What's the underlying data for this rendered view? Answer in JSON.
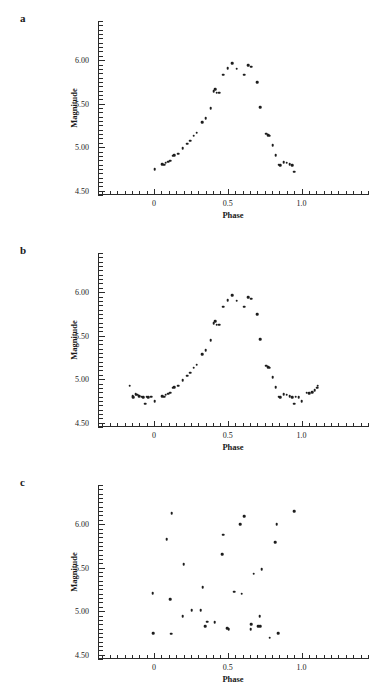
{
  "figure": {
    "panels": [
      {
        "letter": "a"
      },
      {
        "letter": "b"
      },
      {
        "letter": "c"
      }
    ],
    "axis_titles": {
      "x": "Phase",
      "y": "Magnitude"
    }
  },
  "chart_data": [
    {
      "type": "scatter",
      "panel": "a",
      "title": "",
      "xlabel": "Phase",
      "ylabel": "Magnitude",
      "xlim": [
        -0.38,
        1.45
      ],
      "ylim": [
        6.45,
        4.45
      ],
      "y_inverted": true,
      "xticks": [
        0,
        0.5,
        1.0
      ],
      "xticklabels": [
        "0",
        "0.5",
        "1.0"
      ],
      "yticks": [
        4.5,
        5.0,
        5.5,
        6.0
      ],
      "yticklabels": [
        "4.50",
        "5.00",
        "5.50",
        "6.00"
      ],
      "xtick_minor_step": 0.05,
      "ytick_minor_step": 0.05,
      "grid": false,
      "legend": null,
      "marker": "filled-circle",
      "color": "#1d1d1d",
      "points": [
        [
          0.005,
          4.745
        ],
        [
          0.055,
          4.805
        ],
        [
          0.07,
          4.8
        ],
        [
          0.08,
          4.82
        ],
        [
          0.095,
          4.835
        ],
        [
          0.11,
          4.845
        ],
        [
          0.125,
          4.9
        ],
        [
          0.135,
          4.905
        ],
        [
          0.165,
          4.925
        ],
        [
          0.195,
          4.99
        ],
        [
          0.225,
          5.04
        ],
        [
          0.245,
          5.075
        ],
        [
          0.27,
          5.13
        ],
        [
          0.29,
          5.165
        ],
        [
          0.325,
          5.29
        ],
        [
          0.35,
          5.33
        ],
        [
          0.385,
          5.445
        ],
        [
          0.405,
          5.64
        ],
        [
          0.415,
          5.665
        ],
        [
          0.425,
          5.625
        ],
        [
          0.44,
          5.625
        ],
        [
          0.47,
          5.835
        ],
        [
          0.5,
          5.905
        ],
        [
          0.53,
          5.965
        ],
        [
          0.56,
          5.9
        ],
        [
          0.61,
          5.835
        ],
        [
          0.64,
          5.945
        ],
        [
          0.66,
          5.925
        ],
        [
          0.7,
          5.745
        ],
        [
          0.72,
          5.46
        ],
        [
          0.76,
          5.155
        ],
        [
          0.775,
          5.14
        ],
        [
          0.785,
          5.13
        ],
        [
          0.805,
          5.025
        ],
        [
          0.825,
          4.905
        ],
        [
          0.845,
          4.8
        ],
        [
          0.855,
          4.79
        ],
        [
          0.88,
          4.83
        ],
        [
          0.9,
          4.82
        ],
        [
          0.92,
          4.805
        ],
        [
          0.935,
          4.79
        ],
        [
          0.95,
          4.72
        ]
      ]
    },
    {
      "type": "scatter",
      "panel": "b",
      "title": "",
      "xlabel": "Phase",
      "ylabel": "Magnitude",
      "xlim": [
        -0.38,
        1.45
      ],
      "ylim": [
        6.45,
        4.45
      ],
      "y_inverted": true,
      "xticks": [
        0,
        0.5,
        1.0
      ],
      "xticklabels": [
        "0",
        "0.5",
        "1.0"
      ],
      "yticks": [
        4.5,
        5.0,
        5.5,
        6.0
      ],
      "yticklabels": [
        "4.50",
        "5.00",
        "5.50",
        "6.00"
      ],
      "xtick_minor_step": 0.05,
      "ytick_minor_step": 0.05,
      "grid": false,
      "legend": null,
      "marker": "filled-circle",
      "color": "#1d1d1d",
      "points": [
        [
          -0.165,
          4.925
        ],
        [
          -0.145,
          4.805
        ],
        [
          -0.14,
          4.79
        ],
        [
          -0.125,
          4.83
        ],
        [
          -0.115,
          4.82
        ],
        [
          -0.1,
          4.805
        ],
        [
          -0.085,
          4.8
        ],
        [
          -0.075,
          4.79
        ],
        [
          -0.06,
          4.72
        ],
        [
          -0.05,
          4.8
        ],
        [
          -0.04,
          4.79
        ],
        [
          -0.02,
          4.8
        ],
        [
          0.005,
          4.745
        ],
        [
          0.055,
          4.805
        ],
        [
          0.07,
          4.8
        ],
        [
          0.08,
          4.82
        ],
        [
          0.095,
          4.835
        ],
        [
          0.11,
          4.845
        ],
        [
          0.125,
          4.9
        ],
        [
          0.135,
          4.905
        ],
        [
          0.165,
          4.925
        ],
        [
          0.195,
          4.99
        ],
        [
          0.225,
          5.04
        ],
        [
          0.245,
          5.075
        ],
        [
          0.27,
          5.13
        ],
        [
          0.29,
          5.165
        ],
        [
          0.325,
          5.29
        ],
        [
          0.35,
          5.33
        ],
        [
          0.385,
          5.445
        ],
        [
          0.405,
          5.64
        ],
        [
          0.415,
          5.665
        ],
        [
          0.425,
          5.625
        ],
        [
          0.44,
          5.625
        ],
        [
          0.47,
          5.835
        ],
        [
          0.5,
          5.905
        ],
        [
          0.53,
          5.965
        ],
        [
          0.56,
          5.9
        ],
        [
          0.61,
          5.835
        ],
        [
          0.64,
          5.945
        ],
        [
          0.66,
          5.925
        ],
        [
          0.7,
          5.745
        ],
        [
          0.72,
          5.46
        ],
        [
          0.76,
          5.155
        ],
        [
          0.775,
          5.14
        ],
        [
          0.785,
          5.13
        ],
        [
          0.805,
          5.025
        ],
        [
          0.825,
          4.905
        ],
        [
          0.845,
          4.8
        ],
        [
          0.855,
          4.79
        ],
        [
          0.88,
          4.83
        ],
        [
          0.9,
          4.82
        ],
        [
          0.92,
          4.805
        ],
        [
          0.935,
          4.79
        ],
        [
          0.95,
          4.72
        ],
        [
          0.96,
          4.8
        ],
        [
          0.98,
          4.79
        ],
        [
          1.0,
          4.745
        ],
        [
          1.035,
          4.845
        ],
        [
          1.05,
          4.84
        ],
        [
          1.07,
          4.85
        ],
        [
          1.09,
          4.87
        ],
        [
          1.105,
          4.9
        ],
        [
          1.11,
          4.925
        ]
      ]
    },
    {
      "type": "scatter",
      "panel": "c",
      "title": "",
      "xlabel": "Phase",
      "ylabel": "Magnitude",
      "xlim": [
        -0.38,
        1.45
      ],
      "ylim": [
        6.45,
        4.45
      ],
      "y_inverted": true,
      "xticks": [
        0,
        0.5,
        1.0
      ],
      "xticklabels": [
        "0",
        "0.5",
        "1.0"
      ],
      "yticks": [
        4.5,
        5.0,
        5.5,
        6.0
      ],
      "yticklabels": [
        "4.50",
        "5.00",
        "5.50",
        "6.00"
      ],
      "xtick_minor_step": 0.05,
      "ytick_minor_step": 0.05,
      "grid": false,
      "legend": null,
      "marker": "filled-circle",
      "color": "#1d1d1d",
      "points": [
        [
          -0.005,
          4.745
        ],
        [
          -0.01,
          5.205
        ],
        [
          0.085,
          5.83
        ],
        [
          0.11,
          5.135
        ],
        [
          0.115,
          4.74
        ],
        [
          0.12,
          6.125
        ],
        [
          0.195,
          4.945
        ],
        [
          0.2,
          5.54
        ],
        [
          0.255,
          5.01
        ],
        [
          0.315,
          5.01
        ],
        [
          0.33,
          5.275
        ],
        [
          0.345,
          4.83
        ],
        [
          0.36,
          4.88
        ],
        [
          0.41,
          4.87
        ],
        [
          0.46,
          5.655
        ],
        [
          0.47,
          5.88
        ],
        [
          0.495,
          4.805
        ],
        [
          0.505,
          4.795
        ],
        [
          0.545,
          5.225
        ],
        [
          0.585,
          6.0
        ],
        [
          0.595,
          5.2
        ],
        [
          0.61,
          6.09
        ],
        [
          0.655,
          4.79
        ],
        [
          0.66,
          4.85
        ],
        [
          0.675,
          5.43
        ],
        [
          0.705,
          4.825
        ],
        [
          0.715,
          4.94
        ],
        [
          0.72,
          4.83
        ],
        [
          0.73,
          5.48
        ],
        [
          0.785,
          4.695
        ],
        [
          0.82,
          5.795
        ],
        [
          0.83,
          6.0
        ],
        [
          0.84,
          4.745
        ],
        [
          0.95,
          6.15
        ]
      ]
    }
  ]
}
